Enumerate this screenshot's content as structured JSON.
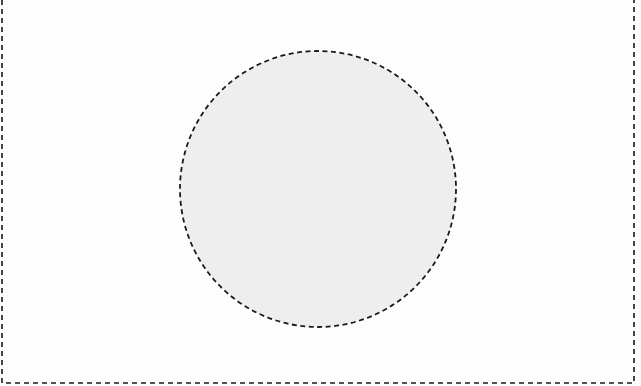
{
  "canvas": {
    "width": 641,
    "height": 386,
    "background": "#fdfdfd"
  },
  "frame": {
    "shape": "open-top-rectangle",
    "left_x": 2,
    "right_x": 634,
    "bottom_y": 383,
    "stroke": "#1a1a1a",
    "stroke_width": 1.6,
    "dash": "5 4"
  },
  "circle": {
    "cx": 318,
    "cy": 189,
    "r": 138,
    "fill": "#eeeeee",
    "stroke": "#1a1a1a",
    "stroke_width": 1.8,
    "dash": "5 3.5",
    "label": ""
  }
}
